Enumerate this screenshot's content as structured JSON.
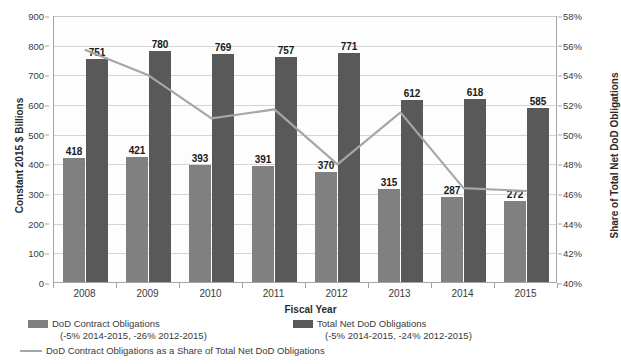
{
  "chart_data": {
    "type": "bar",
    "title": "",
    "xlabel": "Fiscal Year",
    "ylabel": "Constant 2015 $ Billions",
    "y2label": "Share of Total Net DoD Obligations",
    "categories": [
      "2008",
      "2009",
      "2010",
      "2011",
      "2012",
      "2013",
      "2014",
      "2015"
    ],
    "ylim": [
      0,
      900
    ],
    "yticks": [
      "0",
      "100",
      "200",
      "300",
      "400",
      "500",
      "600",
      "700",
      "800",
      "900"
    ],
    "ytick_values": [
      0,
      100,
      200,
      300,
      400,
      500,
      600,
      700,
      800,
      900
    ],
    "y2lim": [
      40,
      58
    ],
    "y2ticks": [
      "40%",
      "42%",
      "44%",
      "46%",
      "48%",
      "50%",
      "52%",
      "54%",
      "56%",
      "58%"
    ],
    "y2tick_values": [
      40,
      42,
      44,
      46,
      48,
      50,
      52,
      54,
      56,
      58
    ],
    "grid": true,
    "legend_position": "bottom",
    "series": [
      {
        "name": "DoD Contract Obligations",
        "sublabel": "(-5% 2014-2015, -26% 2012-2015)",
        "type": "bar",
        "axis": "left",
        "color": "#808080",
        "values": [
          418,
          421,
          393,
          391,
          370,
          315,
          287,
          272
        ],
        "labels": [
          "418",
          "421",
          "393",
          "391",
          "370",
          "315",
          "287",
          "272"
        ]
      },
      {
        "name": "Total Net DoD Obligations",
        "sublabel": "(-5% 2014-2015, -24% 2012-2015)",
        "type": "bar",
        "axis": "left",
        "color": "#595959",
        "values": [
          751,
          780,
          769,
          757,
          771,
          612,
          618,
          585
        ],
        "labels": [
          "751",
          "780",
          "769",
          "757",
          "771",
          "612",
          "618",
          "585"
        ]
      },
      {
        "name": "DoD Contract Obligations as a Share of Total Net DoD Obligations",
        "sublabel": "",
        "type": "line",
        "axis": "right",
        "color": "#a6a6a6",
        "values": [
          55.7,
          54.0,
          51.1,
          51.7,
          48.0,
          51.5,
          46.4,
          46.2
        ]
      }
    ]
  }
}
